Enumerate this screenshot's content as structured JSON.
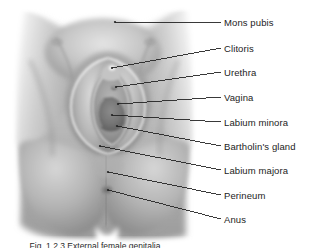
{
  "figure": {
    "caption": "Fig. 1.2.3 External female genitalia",
    "background_color": "#ffffff",
    "label_color": "#1c1c1c",
    "leader_color": "#232323",
    "illustration_tone_light": "#e8e8e8",
    "illustration_tone_mid": "#a8a8a8",
    "illustration_tone_dark": "#6e6e6e"
  },
  "labels": [
    {
      "id": "mons-pubis",
      "text": "Mons pubis",
      "text_x": 224,
      "text_y": 18,
      "leader": {
        "x1": 115,
        "y1": 22,
        "x2": 221,
        "y2": 22
      }
    },
    {
      "id": "clitoris",
      "text": "Clitoris",
      "text_x": 224,
      "text_y": 44,
      "leader": {
        "x1": 112,
        "y1": 68,
        "x2": 221,
        "y2": 48
      }
    },
    {
      "id": "urethra",
      "text": "Urethra",
      "text_x": 224,
      "text_y": 68,
      "leader": {
        "x1": 116,
        "y1": 87,
        "x2": 221,
        "y2": 72
      }
    },
    {
      "id": "vagina",
      "text": "Vagina",
      "text_x": 224,
      "text_y": 93,
      "leader": {
        "x1": 118,
        "y1": 104,
        "x2": 221,
        "y2": 97
      }
    },
    {
      "id": "labium-minora",
      "text": "Labium minora",
      "text_x": 224,
      "text_y": 118,
      "leader": {
        "x1": 112,
        "y1": 115,
        "x2": 221,
        "y2": 122
      }
    },
    {
      "id": "bartholins-gland",
      "text": "Bartholin's gland",
      "text_x": 224,
      "text_y": 142,
      "leader": {
        "x1": 117,
        "y1": 126,
        "x2": 221,
        "y2": 146
      }
    },
    {
      "id": "labium-majora",
      "text": "Labium majora",
      "text_x": 224,
      "text_y": 166,
      "leader": {
        "x1": 100,
        "y1": 146,
        "x2": 221,
        "y2": 170
      }
    },
    {
      "id": "perineum",
      "text": "Perineum",
      "text_x": 224,
      "text_y": 191,
      "leader": {
        "x1": 108,
        "y1": 172,
        "x2": 221,
        "y2": 195
      }
    },
    {
      "id": "anus",
      "text": "Anus",
      "text_x": 224,
      "text_y": 215,
      "leader": {
        "x1": 108,
        "y1": 190,
        "x2": 221,
        "y2": 219
      }
    }
  ]
}
